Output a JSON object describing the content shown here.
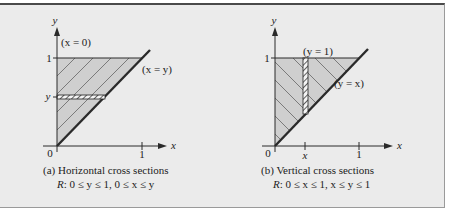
{
  "figure": {
    "panels": [
      {
        "id": "a",
        "axis_x_label": "x",
        "axis_y_label": "y",
        "origin_label": "0",
        "x_tick_labels": [
          "1"
        ],
        "y_tick_labels": [
          "1",
          "y"
        ],
        "boundary_labels": [
          "(x = 0)",
          "(x = y)"
        ],
        "caption_line1": "(a) Horizontal cross sections",
        "caption_r": "R",
        "caption_line2": ": 0 ≤ y ≤ 1, 0 ≤ x ≤ y",
        "cross_section": "horizontal"
      },
      {
        "id": "b",
        "axis_x_label": "x",
        "axis_y_label": "y",
        "origin_label": "0",
        "x_tick_labels": [
          "x",
          "1"
        ],
        "y_tick_labels": [
          "1"
        ],
        "boundary_labels": [
          "(y = 1)",
          "(y = x)"
        ],
        "caption_line1": "(b) Vertical cross sections",
        "caption_r": "R",
        "caption_line2": ": 0 ≤ x ≤ 1, x ≤ y ≤ 1",
        "cross_section": "vertical"
      }
    ],
    "colors": {
      "background": "#ebebeb",
      "region_fill": "#cfcfcf",
      "line": "#2a2a2a",
      "top_rule": "#4a4a4a"
    }
  }
}
